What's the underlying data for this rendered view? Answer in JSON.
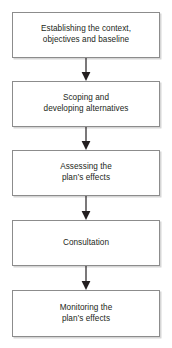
{
  "diagram": {
    "orientation": "vertical-top-to-bottom",
    "box_fill": "#ffffff",
    "box_border": "#8c8c8c",
    "text_color": "#231f20",
    "arrow_color": "#231f20",
    "steps": [
      {
        "id": "establishing-context",
        "label": "Establishing the context,\nobjectives and baseline",
        "top": 12,
        "height": 46
      },
      {
        "id": "scoping-alternatives",
        "label": "Scoping and\ndeveloping alternatives",
        "top": 81,
        "height": 46
      },
      {
        "id": "assessing-effects",
        "label": "Assessing the\nplan’s effects",
        "top": 150,
        "height": 46
      },
      {
        "id": "consultation",
        "label": "Consultation",
        "top": 220,
        "height": 46
      },
      {
        "id": "monitoring-effects",
        "label": "Monitoring the\nplan’s effects",
        "top": 290,
        "height": 47
      }
    ],
    "arrows": [
      {
        "id": "arrow-1",
        "from": "establishing-context",
        "to": "scoping-alternatives",
        "top": 58,
        "height": 23
      },
      {
        "id": "arrow-2",
        "from": "scoping-alternatives",
        "to": "assessing-effects",
        "top": 127,
        "height": 23
      },
      {
        "id": "arrow-3",
        "from": "assessing-effects",
        "to": "consultation",
        "top": 196,
        "height": 24
      },
      {
        "id": "arrow-4",
        "from": "consultation",
        "to": "monitoring-effects",
        "top": 266,
        "height": 24
      }
    ]
  }
}
